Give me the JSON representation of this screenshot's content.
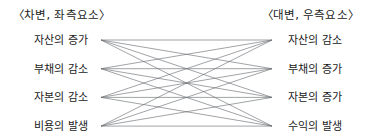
{
  "diagram": {
    "type": "bipartite-relationship",
    "background_color": "#ffffff",
    "edge_color": "#666a6e",
    "text_color": "#1b1b1b",
    "headers": {
      "left": "〈차변, 좌측요소〉",
      "right": "〈대변, 우측요소〉"
    },
    "left_nodes": [
      {
        "label": "자산의 증가"
      },
      {
        "label": "부채의 감소"
      },
      {
        "label": "자본의 감소"
      },
      {
        "label": "비용의 발생"
      }
    ],
    "right_nodes": [
      {
        "label": "자산의 감소"
      },
      {
        "label": "부채의 증가"
      },
      {
        "label": "자본의 증가"
      },
      {
        "label": "수익의 발생"
      }
    ],
    "geometry": {
      "left_x": 101,
      "right_x": 272,
      "row_y": [
        40,
        68.7,
        97.4,
        126.1
      ]
    },
    "edges": [
      [
        0,
        0
      ],
      [
        0,
        1
      ],
      [
        0,
        2
      ],
      [
        0,
        3
      ],
      [
        1,
        0
      ],
      [
        1,
        1
      ],
      [
        1,
        2
      ],
      [
        1,
        3
      ],
      [
        2,
        0
      ],
      [
        2,
        1
      ],
      [
        2,
        2
      ],
      [
        2,
        3
      ],
      [
        3,
        0
      ],
      [
        3,
        1
      ],
      [
        3,
        2
      ],
      [
        3,
        3
      ]
    ]
  }
}
